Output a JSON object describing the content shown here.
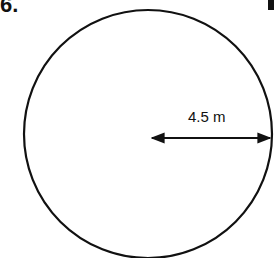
{
  "problem": {
    "number": "6."
  },
  "figure": {
    "shape": "circle",
    "radius_label": "4.5 m",
    "center": [
      148,
      134
    ],
    "radius": 124
  }
}
